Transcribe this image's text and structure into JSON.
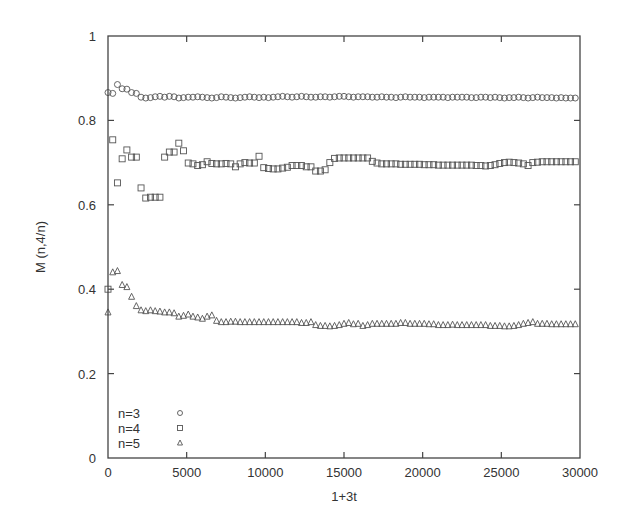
{
  "chart_data": {
    "type": "scatter",
    "title": "",
    "xlabel": "1+3t",
    "ylabel": "M (n,4/n)",
    "xlim": [
      0,
      30000
    ],
    "ylim": [
      0,
      1
    ],
    "xticks": [
      0,
      5000,
      10000,
      15000,
      20000,
      25000,
      30000
    ],
    "xtick_labels": [
      "0",
      "5000",
      "10000",
      "15000",
      "20000",
      "25000",
      "30000"
    ],
    "yticks": [
      0,
      0.2,
      0.4,
      0.6,
      0.8,
      1
    ],
    "ytick_labels": [
      "0",
      "0.2",
      "0.4",
      "0.6",
      "0.8",
      "1"
    ],
    "grid": false,
    "legend_position": "bottom-left",
    "x_step": 300,
    "series": [
      {
        "name": "n=3",
        "label": "n=3",
        "marker": "circle",
        "x_start": 0,
        "values": [
          0.866,
          0.864,
          0.885,
          0.875,
          0.874,
          0.866,
          0.864,
          0.855,
          0.853,
          0.854,
          0.856,
          0.857,
          0.855,
          0.857,
          0.856,
          0.853,
          0.854,
          0.855,
          0.855,
          0.856,
          0.855,
          0.854,
          0.853,
          0.854,
          0.856,
          0.855,
          0.854,
          0.853,
          0.854,
          0.855,
          0.856,
          0.855,
          0.854,
          0.855,
          0.854,
          0.855,
          0.856,
          0.857,
          0.856,
          0.855,
          0.856,
          0.857,
          0.856,
          0.855,
          0.855,
          0.856,
          0.856,
          0.855,
          0.856,
          0.857,
          0.857,
          0.856,
          0.855,
          0.856,
          0.856,
          0.856,
          0.855,
          0.855,
          0.856,
          0.855,
          0.855,
          0.854,
          0.855,
          0.856,
          0.855,
          0.855,
          0.855,
          0.854,
          0.855,
          0.855,
          0.855,
          0.855,
          0.854,
          0.855,
          0.855,
          0.855,
          0.855,
          0.854,
          0.854,
          0.855,
          0.855,
          0.854,
          0.855,
          0.854,
          0.853,
          0.854,
          0.854,
          0.855,
          0.854,
          0.853,
          0.854,
          0.855,
          0.854,
          0.854,
          0.854,
          0.853,
          0.854,
          0.853,
          0.853,
          0.853
        ]
      },
      {
        "name": "n=4",
        "label": "n=4",
        "marker": "square",
        "x_start": 0,
        "values": [
          0.4,
          0.754,
          0.652,
          0.709,
          0.73,
          0.713,
          0.713,
          0.64,
          0.616,
          0.618,
          0.618,
          0.618,
          0.713,
          0.725,
          0.725,
          0.746,
          0.728,
          0.699,
          0.697,
          0.693,
          0.695,
          0.702,
          0.698,
          0.697,
          0.697,
          0.698,
          0.697,
          0.69,
          0.697,
          0.7,
          0.699,
          0.699,
          0.715,
          0.688,
          0.686,
          0.685,
          0.685,
          0.687,
          0.689,
          0.693,
          0.693,
          0.693,
          0.69,
          0.69,
          0.68,
          0.68,
          0.683,
          0.7,
          0.71,
          0.711,
          0.711,
          0.711,
          0.711,
          0.711,
          0.711,
          0.711,
          0.703,
          0.699,
          0.697,
          0.697,
          0.697,
          0.697,
          0.696,
          0.696,
          0.696,
          0.696,
          0.696,
          0.695,
          0.695,
          0.695,
          0.694,
          0.694,
          0.694,
          0.694,
          0.694,
          0.694,
          0.694,
          0.694,
          0.693,
          0.693,
          0.692,
          0.693,
          0.695,
          0.698,
          0.7,
          0.701,
          0.7,
          0.699,
          0.697,
          0.693,
          0.7,
          0.701,
          0.702,
          0.702,
          0.702,
          0.702,
          0.702,
          0.702,
          0.702,
          0.702
        ]
      },
      {
        "name": "n=5",
        "label": "n=5",
        "marker": "triangle",
        "x_start": 0,
        "values": [
          0.345,
          0.44,
          0.443,
          0.41,
          0.405,
          0.382,
          0.36,
          0.35,
          0.348,
          0.35,
          0.348,
          0.347,
          0.345,
          0.345,
          0.343,
          0.335,
          0.337,
          0.34,
          0.335,
          0.333,
          0.33,
          0.335,
          0.338,
          0.325,
          0.322,
          0.322,
          0.323,
          0.323,
          0.322,
          0.322,
          0.322,
          0.322,
          0.322,
          0.322,
          0.322,
          0.322,
          0.322,
          0.322,
          0.322,
          0.322,
          0.322,
          0.32,
          0.32,
          0.322,
          0.315,
          0.313,
          0.313,
          0.312,
          0.313,
          0.315,
          0.318,
          0.32,
          0.317,
          0.318,
          0.313,
          0.315,
          0.318,
          0.318,
          0.318,
          0.318,
          0.318,
          0.318,
          0.32,
          0.32,
          0.318,
          0.318,
          0.318,
          0.318,
          0.317,
          0.317,
          0.315,
          0.315,
          0.315,
          0.316,
          0.315,
          0.315,
          0.315,
          0.315,
          0.315,
          0.315,
          0.315,
          0.313,
          0.313,
          0.313,
          0.312,
          0.312,
          0.313,
          0.315,
          0.318,
          0.32,
          0.322,
          0.318,
          0.318,
          0.318,
          0.317,
          0.317,
          0.317,
          0.317,
          0.317,
          0.317
        ]
      }
    ]
  }
}
